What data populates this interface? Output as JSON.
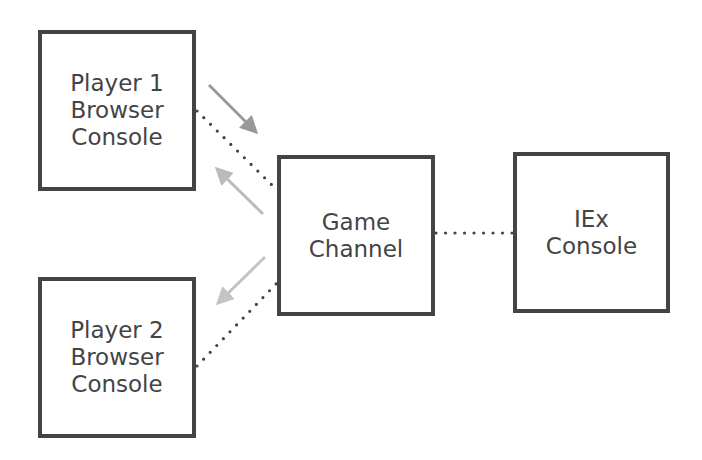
{
  "diagram": {
    "nodes": [
      {
        "id": "player1",
        "label": "Player 1\nBrowser\nConsole",
        "x": 38,
        "y": 30,
        "w": 158,
        "h": 161
      },
      {
        "id": "game_channel",
        "label": "Game\nChannel",
        "x": 277,
        "y": 155,
        "w": 158,
        "h": 161
      },
      {
        "id": "iex",
        "label": "IEx\nConsole",
        "x": 513,
        "y": 152,
        "w": 157,
        "h": 161
      },
      {
        "id": "player2",
        "label": "Player 2\nBrowser\nConsole",
        "x": 38,
        "y": 277,
        "w": 158,
        "h": 161
      }
    ],
    "connections": [
      {
        "from": "player1",
        "to": "game_channel",
        "style": "dotted"
      },
      {
        "from": "player2",
        "to": "game_channel",
        "style": "dotted"
      },
      {
        "from": "game_channel",
        "to": "iex",
        "style": "dotted"
      }
    ],
    "arrows": [
      {
        "from": "player1",
        "to": "game_channel",
        "color": "#999999"
      },
      {
        "from": "game_channel",
        "to": "player1",
        "color": "#bbbbbb"
      },
      {
        "from": "game_channel",
        "to": "player2",
        "color": "#c4c4c4"
      }
    ],
    "colors": {
      "border": "#444444",
      "text": "#444444",
      "dots": "#444444"
    }
  }
}
